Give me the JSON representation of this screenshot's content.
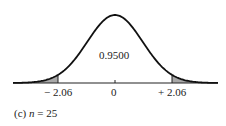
{
  "chart_data": {
    "type": "area",
    "title": "",
    "distribution": "t (normal-shaped density curve)",
    "center_value_label": "0.9500",
    "x_ticks": [
      "-2.06",
      "0",
      "+2.06"
    ],
    "critical_values": [
      -2.06,
      2.06
    ],
    "central_area": 0.95,
    "shaded_regions": [
      "left tail x < -2.06",
      "right tail x > +2.06"
    ],
    "caption": "(c) n = 25",
    "xlabel": "",
    "ylabel": "",
    "grid": false,
    "colors": {
      "curve": "#111111",
      "tail_fill": "#a8a8a8",
      "axis": "#222222"
    }
  },
  "labels": {
    "center": "0.9500",
    "tick_neg": "− 2.06",
    "tick_zero": "0",
    "tick_pos": "+ 2.06",
    "caption_prefix": "(c) ",
    "caption_var": "n",
    "caption_rest": " = 25"
  }
}
